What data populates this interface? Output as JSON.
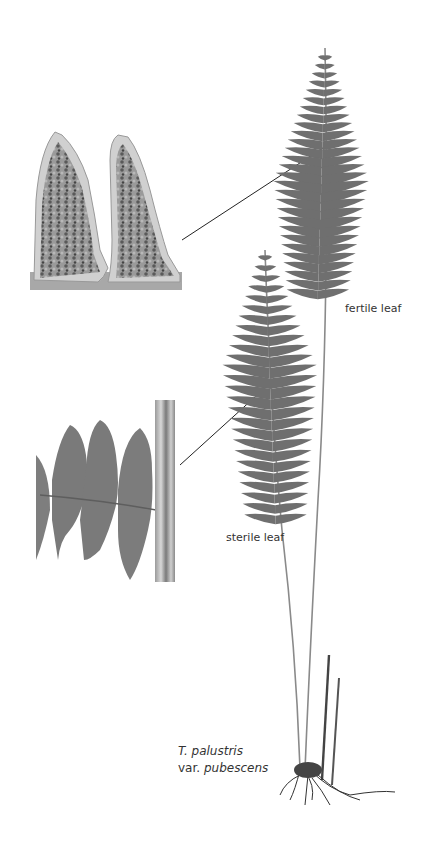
{
  "figure": {
    "labels": {
      "fertile": "fertile leaf",
      "sterile": "sterile leaf"
    },
    "species": {
      "line1_italic": "T. palustris",
      "line2_prefix": "var. ",
      "line2_italic": "pubescens"
    },
    "insets": [
      {
        "name": "fertile-pinnule-closeup",
        "description": "close-up of fertile pinnules with sori"
      },
      {
        "name": "sterile-pinna-closeup",
        "description": "close-up of sterile pinna attached to rachis"
      }
    ],
    "colors": {
      "frond": "#6f6f6f",
      "stem": "#8a8a8a",
      "callout_line": "#222222",
      "text": "#333333"
    }
  }
}
